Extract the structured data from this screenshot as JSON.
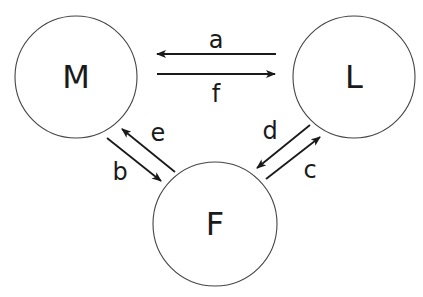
{
  "diagram": {
    "nodes": [
      {
        "id": "M",
        "label": "M",
        "cx": 76,
        "cy": 77,
        "r": 61
      },
      {
        "id": "L",
        "label": "L",
        "cx": 354,
        "cy": 77,
        "r": 61
      },
      {
        "id": "F",
        "label": "F",
        "cx": 215,
        "cy": 224,
        "r": 62
      }
    ],
    "edges": [
      {
        "id": "a",
        "label": "a",
        "from": "L",
        "to": "M",
        "x1": 276,
        "y1": 54,
        "x2": 157,
        "y2": 54,
        "lx": 216,
        "ly": 40
      },
      {
        "id": "f",
        "label": "f",
        "from": "M",
        "to": "L",
        "x1": 157,
        "y1": 74,
        "x2": 275,
        "y2": 74,
        "lx": 216,
        "ly": 94
      },
      {
        "id": "b",
        "label": "b",
        "from": "M",
        "to": "F",
        "x1": 107,
        "y1": 138,
        "x2": 161,
        "y2": 181,
        "lx": 120,
        "ly": 172
      },
      {
        "id": "e",
        "label": "e",
        "from": "F",
        "to": "M",
        "x1": 175,
        "y1": 172,
        "x2": 122,
        "y2": 129,
        "lx": 158,
        "ly": 133
      },
      {
        "id": "d",
        "label": "d",
        "from": "L",
        "to": "F",
        "x1": 310,
        "y1": 125,
        "x2": 257,
        "y2": 168,
        "lx": 270,
        "ly": 131
      },
      {
        "id": "c",
        "label": "c",
        "from": "F",
        "to": "L",
        "x1": 266,
        "y1": 179,
        "x2": 320,
        "y2": 137,
        "lx": 310,
        "ly": 170
      }
    ]
  }
}
